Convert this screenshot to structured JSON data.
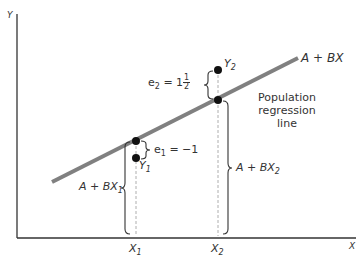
{
  "diagram": {
    "axes": {
      "y_label": "Y",
      "x_label": "X"
    },
    "line": {
      "label": "A + BX",
      "description_lines": [
        "Population",
        "regression",
        "line"
      ],
      "color": "#808080"
    },
    "points": {
      "x1": {
        "tick": "X",
        "tick_sub": "1",
        "obs": "Y",
        "obs_sub": "1",
        "fitted": "A + BX",
        "fitted_sub": "1",
        "error_label": "e",
        "error_sub": "1",
        "error_value": "= −1"
      },
      "x2": {
        "tick": "X",
        "tick_sub": "2",
        "obs": "Y",
        "obs_sub": "2",
        "fitted": "A + BX",
        "fitted_sub": "2",
        "error_label": "e",
        "error_sub": "2",
        "error_value_prefix": "= 1",
        "error_frac_num": "1",
        "error_frac_den": "2"
      }
    }
  }
}
